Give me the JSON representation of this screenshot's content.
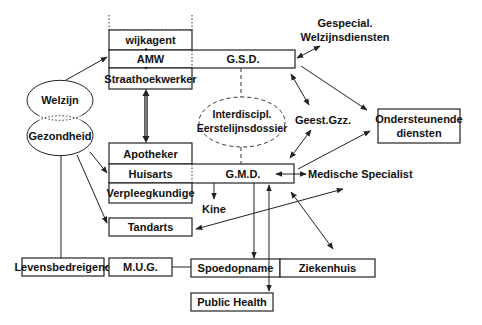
{
  "diagram": {
    "title": "",
    "top_block": {
      "wijkagent": "wijkagent",
      "amw": "AMW",
      "gsd": "G.S.D.",
      "straathoekwerker": "Straathoekwerker"
    },
    "middle_block": {
      "apotheker": "Apotheker",
      "huisarts": "Huisarts",
      "gmd": "G.M.D.",
      "verpleegkundige": "Verpleegkundige"
    },
    "ellipses": {
      "welzijn": "Welzijn",
      "gezondheid": "Gezondheid",
      "dossier_line1": "Interdiscipl.",
      "dossier_line2": "Eerstelijnsdossier"
    },
    "labels": {
      "gespecial_line1": "Gespecial.",
      "gespecial_line2": "Welzijnsdiensten",
      "geest_gzz": "Geest.Gzz.",
      "medische_specialist": "Medische Specialist",
      "kine": "Kine"
    },
    "boxes": {
      "ondersteunende_line1": "Ondersteunende",
      "ondersteunende_line2": "diensten",
      "tandarts": "Tandarts",
      "levensbedreigend": "Levensbedreigend",
      "mug": "M.U.G.",
      "spoedopname": "Spoedopname",
      "ziekenhuis": "Ziekenhuis",
      "public_health": "Public Health"
    },
    "connections": [
      {
        "from": "Welzijn",
        "to": "AMW",
        "type": "arrow"
      },
      {
        "from": "Straathoekwerker",
        "to": "Apotheker",
        "type": "double-arrow"
      },
      {
        "from": "Gezondheid",
        "to": "Huisarts",
        "type": "arrow"
      },
      {
        "from": "Gezondheid",
        "to": "Tandarts",
        "type": "arrow"
      },
      {
        "from": "Gezondheid",
        "to": "Levensbedreigend",
        "type": "line"
      },
      {
        "from": "G.S.D.",
        "to": "Gespecial. Welzijnsdiensten",
        "type": "double-arrow"
      },
      {
        "from": "G.S.D.",
        "to": "Geest.Gzz.",
        "type": "double-arrow"
      },
      {
        "from": "G.S.D.",
        "to": "Ondersteunende diensten",
        "type": "arrow"
      },
      {
        "from": "Geest.Gzz.",
        "to": "G.M.D.",
        "type": "double-arrow"
      },
      {
        "from": "G.M.D.",
        "to": "Ondersteunende diensten",
        "type": "arrow"
      },
      {
        "from": "G.M.D.",
        "to": "Medische Specialist",
        "type": "double-arrow"
      },
      {
        "from": "G.M.D.",
        "to": "Kine",
        "type": "arrow"
      },
      {
        "from": "G.M.D.",
        "to": "Spoedopname",
        "type": "arrow"
      },
      {
        "from": "G.M.D.",
        "to": "Public Health",
        "type": "double-arrow"
      },
      {
        "from": "G.M.D.",
        "to": "Ziekenhuis",
        "type": "double-arrow"
      },
      {
        "from": "Tandarts",
        "to": "Medische Specialist",
        "type": "double-arrow"
      },
      {
        "from": "Levensbedreigend",
        "to": "M.U.G.",
        "type": "line"
      },
      {
        "from": "M.U.G.",
        "to": "Spoedopname",
        "type": "line"
      },
      {
        "from": "G.S.D.",
        "to": "Interdiscipl. Eerstelijnsdossier",
        "type": "dashed"
      },
      {
        "from": "Interdiscipl. Eerstelijnsdossier",
        "to": "G.M.D.",
        "type": "dashed"
      }
    ]
  }
}
